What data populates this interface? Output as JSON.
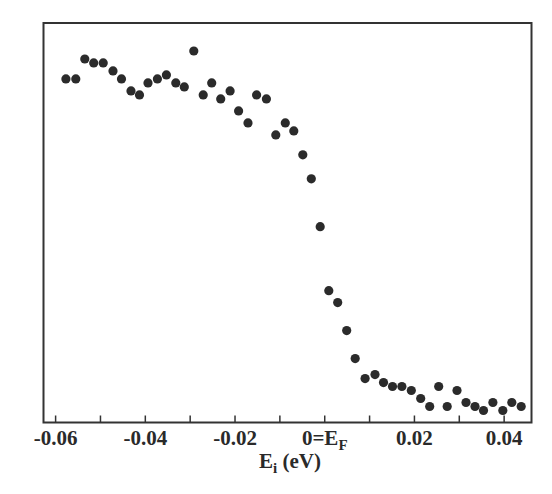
{
  "chart_data": {
    "type": "scatter",
    "title": "",
    "xlabel": "E_i (eV)",
    "xlabel_main": "E",
    "xlabel_sub": "i",
    "xlabel_rest": " (eV)",
    "ylabel": "",
    "xlim": [
      -0.0627,
      0.0461
    ],
    "ylim": [
      0,
      1
    ],
    "grid": false,
    "legend": null,
    "x_ticks_major": [
      -0.06,
      -0.04,
      -0.02,
      0,
      0.02,
      0.04
    ],
    "x_ticks_minor": [
      -0.05,
      -0.03,
      -0.01,
      0.01,
      0.03
    ],
    "x_tick_labels": [
      "-0.06",
      "-0.04",
      "-0.02",
      "0=E",
      "0.02",
      "0.04"
    ],
    "zero_label_sub": "F",
    "y_ticks": [],
    "marker_color": "#2b2b2b",
    "series": [
      {
        "name": "data",
        "x": [
          -0.0577,
          -0.0555,
          -0.0535,
          -0.0515,
          -0.0494,
          -0.0472,
          -0.0453,
          -0.0432,
          -0.0413,
          -0.0394,
          -0.0373,
          -0.0353,
          -0.0332,
          -0.0313,
          -0.0292,
          -0.0271,
          -0.0252,
          -0.0232,
          -0.0211,
          -0.0192,
          -0.0171,
          -0.0152,
          -0.013,
          -0.0109,
          -0.0088,
          -0.0069,
          -0.0049,
          -0.003,
          -0.001,
          0.0009,
          0.0029,
          0.0049,
          0.0068,
          0.009,
          0.0112,
          0.0131,
          0.0151,
          0.0172,
          0.0193,
          0.0214,
          0.0234,
          0.0254,
          0.0273,
          0.0295,
          0.0315,
          0.0335,
          0.0354,
          0.0375,
          0.0397,
          0.0417,
          0.0438
        ],
        "y": [
          0.86,
          0.86,
          0.91,
          0.9,
          0.9,
          0.88,
          0.86,
          0.83,
          0.82,
          0.85,
          0.86,
          0.87,
          0.85,
          0.84,
          0.93,
          0.82,
          0.85,
          0.81,
          0.83,
          0.78,
          0.75,
          0.82,
          0.81,
          0.72,
          0.75,
          0.73,
          0.67,
          0.61,
          0.49,
          0.33,
          0.3,
          0.23,
          0.16,
          0.11,
          0.12,
          0.1,
          0.09,
          0.09,
          0.08,
          0.06,
          0.04,
          0.09,
          0.04,
          0.08,
          0.05,
          0.04,
          0.03,
          0.05,
          0.03,
          0.05,
          0.04
        ]
      }
    ]
  }
}
